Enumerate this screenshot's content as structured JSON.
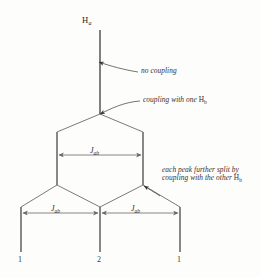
{
  "figure": {
    "kind": "nmr-splitting-tree-diagram",
    "background_color": "#fdfdfc",
    "line_color": "#4a4848",
    "peak_color": "#585555",
    "arrow_color": "#6a6767"
  },
  "species_label": {
    "element": "H",
    "subscript": "a",
    "full": "Ha"
  },
  "annotations": [
    {
      "id": "no-coupling",
      "text": "no coupling",
      "target_x": 99,
      "target_y": 62
    },
    {
      "id": "coupling-one-hb",
      "text_before": "coupling with one ",
      "element": "H",
      "subscript": "b",
      "full": "coupling with one Hb",
      "target_x": 100,
      "target_y": 114
    },
    {
      "id": "further-split-other-hb",
      "line1": "each peak further split by",
      "line2_before": "coupling with the other ",
      "element": "H",
      "subscript": "b",
      "full": "each peak further split by coupling with the other Hb",
      "target_x": 144,
      "target_y": 186
    }
  ],
  "coupling_measurements": [
    {
      "id": "jab-upper",
      "symbol": "J",
      "subscript": "ab",
      "full": "Jab",
      "y": 155,
      "x_start": 57,
      "x_end": 143
    },
    {
      "id": "jab-lower-left",
      "symbol": "J",
      "subscript": "ab",
      "full": "Jab",
      "y": 213,
      "x_start": 21,
      "x_end": 100
    },
    {
      "id": "jab-lower-right",
      "symbol": "J",
      "subscript": "ab",
      "full": "Jab",
      "y": 213,
      "x_start": 100,
      "x_end": 180
    }
  ],
  "peaks": [
    {
      "id": "peak-left",
      "intensity": "1",
      "x": 21,
      "label_y": 262
    },
    {
      "id": "peak-center",
      "intensity": "2",
      "x": 100,
      "label_y": 262
    },
    {
      "id": "peak-right",
      "intensity": "1",
      "x": 180,
      "label_y": 262
    }
  ],
  "tree": {
    "stem": {
      "x": 100,
      "y_top": 30,
      "y_bottom": 114
    },
    "level1_node": {
      "x": 100,
      "y": 114
    },
    "level1_branches": [
      {
        "x": 57,
        "y": 132
      },
      {
        "x": 143,
        "y": 132
      }
    ],
    "level2_nodes": [
      {
        "x": 57,
        "y": 185
      },
      {
        "x": 143,
        "y": 185
      }
    ],
    "level3_lines": [
      {
        "x": 21,
        "y_top": 207,
        "y_bottom": 252
      },
      {
        "x": 100,
        "y_top": 207,
        "y_bottom": 252
      },
      {
        "x": 180,
        "y_top": 207,
        "y_bottom": 252
      }
    ]
  }
}
